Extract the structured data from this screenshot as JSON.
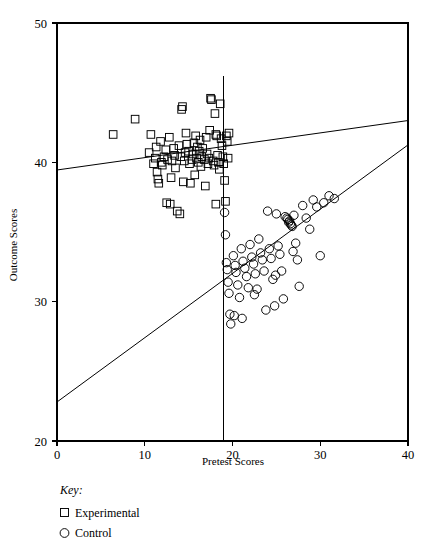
{
  "chart_data": {
    "type": "scatter",
    "title": "",
    "xlabel": "Pretest Scores",
    "ylabel": "Outcome Scores",
    "xlim": [
      0,
      40
    ],
    "ylim": [
      20,
      50
    ],
    "xticks": [
      0,
      10,
      20,
      30,
      40
    ],
    "xtick_labels": [
      "0",
      "10",
      "20",
      "30",
      "40"
    ],
    "yticks": [
      20,
      30,
      40,
      50
    ],
    "ytick_labels": [
      "20",
      "30",
      "40",
      "50"
    ],
    "grid": false,
    "legend_position": "below-axis-left",
    "legend_title": "Key:",
    "series": [
      {
        "name": "Experimental",
        "marker": "square",
        "color": "#000000",
        "points": [
          [
            6.4,
            42.0
          ],
          [
            8.9,
            43.1
          ],
          [
            10.5,
            40.7
          ],
          [
            10.7,
            42.0
          ],
          [
            11.0,
            39.9
          ],
          [
            11.2,
            40.3
          ],
          [
            11.3,
            41.1
          ],
          [
            11.4,
            39.3
          ],
          [
            11.5,
            38.8
          ],
          [
            11.6,
            38.5
          ],
          [
            11.9,
            40.0
          ],
          [
            12.0,
            39.8
          ],
          [
            12.2,
            40.4
          ],
          [
            12.4,
            40.9
          ],
          [
            12.6,
            40.2
          ],
          [
            12.9,
            37.0
          ],
          [
            13.1,
            40.1
          ],
          [
            13.3,
            41.0
          ],
          [
            13.4,
            40.5
          ],
          [
            13.5,
            39.6
          ],
          [
            13.7,
            36.5
          ],
          [
            13.9,
            41.2
          ],
          [
            14.1,
            40.4
          ],
          [
            14.2,
            43.8
          ],
          [
            14.3,
            44.0
          ],
          [
            14.4,
            38.6
          ],
          [
            14.5,
            40.1
          ],
          [
            14.6,
            40.7
          ],
          [
            14.8,
            41.3
          ],
          [
            15.0,
            40.8
          ],
          [
            15.1,
            39.9
          ],
          [
            15.2,
            38.5
          ],
          [
            15.4,
            40.2
          ],
          [
            15.5,
            40.6
          ],
          [
            15.6,
            41.4
          ],
          [
            15.8,
            41.9
          ],
          [
            15.9,
            40.3
          ],
          [
            16.0,
            41.1
          ],
          [
            16.1,
            40.0
          ],
          [
            16.2,
            40.8
          ],
          [
            16.3,
            41.6
          ],
          [
            16.4,
            39.7
          ],
          [
            16.5,
            40.4
          ],
          [
            16.6,
            41.0
          ],
          [
            16.8,
            40.2
          ],
          [
            17.0,
            41.8
          ],
          [
            17.1,
            40.6
          ],
          [
            17.2,
            39.9
          ],
          [
            17.3,
            40.3
          ],
          [
            17.5,
            44.6
          ],
          [
            17.6,
            44.5
          ],
          [
            17.8,
            40.1
          ],
          [
            17.9,
            39.8
          ],
          [
            18.0,
            43.5
          ],
          [
            18.1,
            42.0
          ],
          [
            18.2,
            41.9
          ],
          [
            18.3,
            40.5
          ],
          [
            18.4,
            40.0
          ],
          [
            18.5,
            39.5
          ],
          [
            18.6,
            44.2
          ],
          [
            18.7,
            41.7
          ],
          [
            18.8,
            41.2
          ],
          [
            18.9,
            40.4
          ],
          [
            19.0,
            39.9
          ],
          [
            19.1,
            38.7
          ],
          [
            19.2,
            37.2
          ],
          [
            19.3,
            41.9
          ],
          [
            19.4,
            41.5
          ],
          [
            19.5,
            40.3
          ],
          [
            12.5,
            37.1
          ],
          [
            14.0,
            36.3
          ],
          [
            13.0,
            38.9
          ],
          [
            15.7,
            39.1
          ],
          [
            16.9,
            38.3
          ],
          [
            18.1,
            37.0
          ],
          [
            11.8,
            41.5
          ],
          [
            12.8,
            41.8
          ],
          [
            14.7,
            42.1
          ],
          [
            17.4,
            42.3
          ],
          [
            19.6,
            42.1
          ]
        ]
      },
      {
        "name": "Control",
        "marker": "circle",
        "color": "#000000",
        "points": [
          [
            19.1,
            36.4
          ],
          [
            19.2,
            34.8
          ],
          [
            19.3,
            32.8
          ],
          [
            19.4,
            32.3
          ],
          [
            19.5,
            31.4
          ],
          [
            19.6,
            30.6
          ],
          [
            19.7,
            29.1
          ],
          [
            19.8,
            28.4
          ],
          [
            20.1,
            33.3
          ],
          [
            20.3,
            32.6
          ],
          [
            20.4,
            32.1
          ],
          [
            20.6,
            31.2
          ],
          [
            20.8,
            30.3
          ],
          [
            21.0,
            33.8
          ],
          [
            21.2,
            32.9
          ],
          [
            21.4,
            32.4
          ],
          [
            21.6,
            31.8
          ],
          [
            21.8,
            31.0
          ],
          [
            22.0,
            34.1
          ],
          [
            22.2,
            33.2
          ],
          [
            22.4,
            32.7
          ],
          [
            22.6,
            32.0
          ],
          [
            22.8,
            30.9
          ],
          [
            23.0,
            34.5
          ],
          [
            23.2,
            33.5
          ],
          [
            23.4,
            33.0
          ],
          [
            23.6,
            32.2
          ],
          [
            23.8,
            29.4
          ],
          [
            24.0,
            36.5
          ],
          [
            24.2,
            33.8
          ],
          [
            24.4,
            33.1
          ],
          [
            24.6,
            31.6
          ],
          [
            24.8,
            29.7
          ],
          [
            25.0,
            36.3
          ],
          [
            25.2,
            34.0
          ],
          [
            25.4,
            33.4
          ],
          [
            25.6,
            32.2
          ],
          [
            25.8,
            30.2
          ],
          [
            26.0,
            36.1
          ],
          [
            26.2,
            36.0
          ],
          [
            26.3,
            35.9
          ],
          [
            26.4,
            35.7
          ],
          [
            26.5,
            35.8
          ],
          [
            26.6,
            35.6
          ],
          [
            26.7,
            35.5
          ],
          [
            26.8,
            35.4
          ],
          [
            27.0,
            36.2
          ],
          [
            27.2,
            34.2
          ],
          [
            27.4,
            33.0
          ],
          [
            27.6,
            31.1
          ],
          [
            28.0,
            36.9
          ],
          [
            28.4,
            36.0
          ],
          [
            28.8,
            35.2
          ],
          [
            29.2,
            37.3
          ],
          [
            29.6,
            36.8
          ],
          [
            30.0,
            33.3
          ],
          [
            30.4,
            37.1
          ],
          [
            31.0,
            37.6
          ],
          [
            31.6,
            37.4
          ],
          [
            20.2,
            29.0
          ],
          [
            21.1,
            28.8
          ],
          [
            22.5,
            30.5
          ],
          [
            24.9,
            31.9
          ],
          [
            26.9,
            33.6
          ]
        ]
      }
    ],
    "reference_lines": [
      {
        "name": "experimental-regression",
        "from": [
          0,
          39.45
        ],
        "to": [
          40,
          43.0
        ]
      },
      {
        "name": "control-regression",
        "from": [
          0,
          22.8
        ],
        "to": [
          40,
          41.25
        ]
      },
      {
        "name": "cutoff-vertical",
        "x": 19,
        "from_y": 20,
        "to_y": 46.2
      }
    ]
  },
  "legend": {
    "title": "Key:",
    "entries": [
      {
        "label": "Experimental",
        "marker": "square"
      },
      {
        "label": "Control",
        "marker": "circle"
      }
    ]
  }
}
